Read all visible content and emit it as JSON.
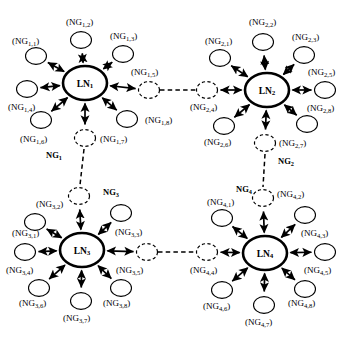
{
  "figure": {
    "node_shape": "ellipse",
    "background_color": "#ffffff",
    "line_color": "#000000",
    "arrow_style": "double-headed",
    "hub_stroke_width": 2.6,
    "satellite_stroke_width": 1.1,
    "bridge_style": "dashed"
  },
  "clusters": [
    {
      "id": "cluster-1",
      "group_label": "NG",
      "group_sub": "1",
      "group_label_pos": {
        "x": 46,
        "y": 155
      },
      "hub": {
        "label": "LN",
        "sub": "1",
        "cx": 85,
        "cy": 83,
        "rx": 22,
        "ry": 17
      },
      "satellites": [
        {
          "label": "NG",
          "sub": "1,1",
          "cx": 36,
          "cy": 56,
          "dashed": false,
          "text_x": 12,
          "text_y": 41,
          "anchor": "start"
        },
        {
          "label": "NG",
          "sub": "1,2",
          "cx": 81,
          "cy": 40,
          "dashed": false,
          "text_x": 66,
          "text_y": 22,
          "anchor": "start"
        },
        {
          "label": "NG",
          "sub": "1,3",
          "cx": 123,
          "cy": 54,
          "dashed": false,
          "text_x": 110,
          "text_y": 36,
          "anchor": "start"
        },
        {
          "label": "NG",
          "sub": "1,4",
          "cx": 27,
          "cy": 89,
          "dashed": false,
          "text_x": 8,
          "text_y": 107,
          "anchor": "start"
        },
        {
          "label": "NG",
          "sub": "1,5",
          "cx": 149,
          "cy": 90,
          "dashed": true,
          "text_x": 131,
          "text_y": 72,
          "anchor": "start"
        },
        {
          "label": "NG",
          "sub": "1,6",
          "cx": 41,
          "cy": 120,
          "dashed": false,
          "text_x": 20,
          "text_y": 139,
          "anchor": "start"
        },
        {
          "label": "NG",
          "sub": "1,7",
          "cx": 85,
          "cy": 138,
          "dashed": true,
          "text_x": 100,
          "text_y": 139,
          "anchor": "start"
        },
        {
          "label": "NG",
          "sub": "1,8",
          "cx": 127,
          "cy": 119,
          "dashed": false,
          "text_x": 145,
          "text_y": 120,
          "anchor": "start"
        }
      ]
    },
    {
      "id": "cluster-2",
      "group_label": "NG",
      "group_sub": "2",
      "group_label_pos": {
        "x": 278,
        "y": 161
      },
      "hub": {
        "label": "LN",
        "sub": "2",
        "cx": 267,
        "cy": 90,
        "rx": 22,
        "ry": 17
      },
      "satellites": [
        {
          "label": "NG",
          "sub": "2,1",
          "cx": 220,
          "cy": 58,
          "dashed": false,
          "text_x": 205,
          "text_y": 41,
          "anchor": "start"
        },
        {
          "label": "NG",
          "sub": "2,2",
          "cx": 263,
          "cy": 42,
          "dashed": false,
          "text_x": 249,
          "text_y": 22,
          "anchor": "start"
        },
        {
          "label": "NG",
          "sub": "2,3",
          "cx": 304,
          "cy": 55,
          "dashed": false,
          "text_x": 292,
          "text_y": 37,
          "anchor": "start"
        },
        {
          "label": "NG",
          "sub": "2,4",
          "cx": 207,
          "cy": 90,
          "dashed": true,
          "text_x": 190,
          "text_y": 107,
          "anchor": "start"
        },
        {
          "label": "NG",
          "sub": "2,5",
          "cx": 325,
          "cy": 90,
          "dashed": false,
          "text_x": 308,
          "text_y": 72,
          "anchor": "start"
        },
        {
          "label": "NG",
          "sub": "2,6",
          "cx": 224,
          "cy": 126,
          "dashed": false,
          "text_x": 204,
          "text_y": 142,
          "anchor": "start"
        },
        {
          "label": "NG",
          "sub": "2,7",
          "cx": 265,
          "cy": 143,
          "dashed": true,
          "text_x": 279,
          "text_y": 143,
          "anchor": "start"
        },
        {
          "label": "NG",
          "sub": "2,8",
          "cx": 307,
          "cy": 124,
          "dashed": false,
          "text_x": 307,
          "text_y": 108,
          "anchor": "start"
        }
      ]
    },
    {
      "id": "cluster-3",
      "group_label": "NG",
      "group_sub": "3",
      "group_label_pos": {
        "x": 103,
        "y": 192
      },
      "hub": {
        "label": "LN",
        "sub": "3",
        "cx": 82,
        "cy": 250,
        "rx": 22,
        "ry": 17
      },
      "satellites": [
        {
          "label": "NG",
          "sub": "3,1",
          "cx": 35,
          "cy": 222,
          "dashed": false,
          "text_x": 12,
          "text_y": 233,
          "anchor": "start"
        },
        {
          "label": "NG",
          "sub": "3,2",
          "cx": 79,
          "cy": 196,
          "dashed": true,
          "text_x": 36,
          "text_y": 204,
          "anchor": "start"
        },
        {
          "label": "NG",
          "sub": "3,3",
          "cx": 121,
          "cy": 213,
          "dashed": false,
          "text_x": 115,
          "text_y": 232,
          "anchor": "start"
        },
        {
          "label": "NG",
          "sub": "3,4",
          "cx": 25,
          "cy": 252,
          "dashed": false,
          "text_x": 6,
          "text_y": 270,
          "anchor": "start"
        },
        {
          "label": "NG",
          "sub": "3,5",
          "cx": 147,
          "cy": 252,
          "dashed": true,
          "text_x": 116,
          "text_y": 270,
          "anchor": "start"
        },
        {
          "label": "NG",
          "sub": "3,6",
          "cx": 39,
          "cy": 288,
          "dashed": false,
          "text_x": 19,
          "text_y": 303,
          "anchor": "start"
        },
        {
          "label": "NG",
          "sub": "3,7",
          "cx": 81,
          "cy": 301,
          "dashed": false,
          "text_x": 63,
          "text_y": 318,
          "anchor": "start"
        },
        {
          "label": "NG",
          "sub": "3,8",
          "cx": 121,
          "cy": 288,
          "dashed": false,
          "text_x": 103,
          "text_y": 303,
          "anchor": "start"
        }
      ]
    },
    {
      "id": "cluster-4",
      "group_label": "NG",
      "group_sub": "4",
      "group_label_pos": {
        "x": 236,
        "y": 189
      },
      "hub": {
        "label": "LN",
        "sub": "4",
        "cx": 265,
        "cy": 253,
        "rx": 22,
        "ry": 17
      },
      "satellites": [
        {
          "label": "NG",
          "sub": "4,1",
          "cx": 222,
          "cy": 218,
          "dashed": false,
          "text_x": 207,
          "text_y": 202,
          "anchor": "start"
        },
        {
          "label": "NG",
          "sub": "4,2",
          "cx": 263,
          "cy": 198,
          "dashed": true,
          "text_x": 277,
          "text_y": 194,
          "anchor": "start"
        },
        {
          "label": "NG",
          "sub": "4,3",
          "cx": 305,
          "cy": 215,
          "dashed": false,
          "text_x": 301,
          "text_y": 233,
          "anchor": "start"
        },
        {
          "label": "NG",
          "sub": "4,4",
          "cx": 207,
          "cy": 252,
          "dashed": true,
          "text_x": 190,
          "text_y": 270,
          "anchor": "start"
        },
        {
          "label": "NG",
          "sub": "4,5",
          "cx": 325,
          "cy": 252,
          "dashed": false,
          "text_x": 304,
          "text_y": 270,
          "anchor": "start"
        },
        {
          "label": "NG",
          "sub": "4,6",
          "cx": 222,
          "cy": 290,
          "dashed": false,
          "text_x": 203,
          "text_y": 306,
          "anchor": "start"
        },
        {
          "label": "NG",
          "sub": "4,7",
          "cx": 264,
          "cy": 305,
          "dashed": false,
          "text_x": 245,
          "text_y": 322,
          "anchor": "start"
        },
        {
          "label": "NG",
          "sub": "4,8",
          "cx": 305,
          "cy": 289,
          "dashed": false,
          "text_x": 288,
          "text_y": 303,
          "anchor": "start"
        }
      ]
    }
  ],
  "bridges": [
    {
      "id": "bridge-1-2",
      "from": "NG1,5",
      "to": "NG2,4",
      "x1": 160,
      "y1": 90,
      "x2": 196,
      "y2": 90,
      "orientation": "horizontal"
    },
    {
      "id": "bridge-3-4",
      "from": "NG3,5",
      "to": "NG4,4",
      "x1": 158,
      "y1": 252,
      "x2": 196,
      "y2": 252,
      "orientation": "horizontal"
    },
    {
      "id": "bridge-1-3",
      "from": "NG1,7",
      "to": "NG3,2",
      "x1": 84,
      "y1": 149,
      "x2": 80,
      "y2": 185,
      "orientation": "vertical"
    },
    {
      "id": "bridge-2-4",
      "from": "NG2,7",
      "to": "NG4,2",
      "x1": 265,
      "y1": 154,
      "x2": 263,
      "y2": 187,
      "orientation": "vertical"
    }
  ]
}
